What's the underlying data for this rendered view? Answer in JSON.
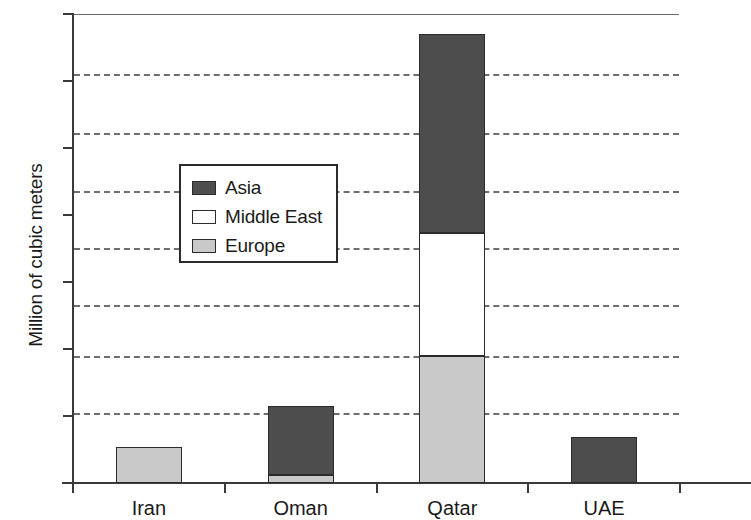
{
  "chart_data": {
    "type": "bar",
    "subtype": "stacked-vertical",
    "title": "",
    "xlabel": "",
    "ylabel": "Million of cubic meters",
    "categories": [
      "Iran",
      "Oman",
      "Qatar",
      "UAE"
    ],
    "series": [
      {
        "name": "Europe",
        "color": "#c9c9c9",
        "values": [
          5.3,
          1.2,
          19.0,
          0
        ]
      },
      {
        "name": "Middle East",
        "color": "#ffffff",
        "values": [
          0,
          0,
          18.3,
          0
        ]
      },
      {
        "name": "Asia",
        "color": "#4d4d4d",
        "values": [
          0,
          10.3,
          29.7,
          6.8
        ]
      }
    ],
    "totals": [
      5.3,
      11.5,
      67.0,
      6.8
    ],
    "stack_order": [
      "Europe",
      "Middle East",
      "Asia"
    ],
    "ylim": [
      0,
      70
    ],
    "yticks": [
      0,
      10,
      20,
      30,
      40,
      50,
      60,
      70
    ],
    "ytick_labels": [
      "0",
      "10",
      "20",
      "30",
      "40",
      "50",
      "60",
      "70"
    ],
    "gridlines": [
      10.5,
      19.0,
      26.6,
      35.1,
      43.6,
      52.2,
      61.0
    ],
    "grid": true,
    "grid_style": "dashed",
    "legend": {
      "position": "upper-left-inside",
      "entries": [
        {
          "label": "Asia",
          "color": "#4d4d4d"
        },
        {
          "label": "Middle East",
          "color": "#ffffff"
        },
        {
          "label": "Europe",
          "color": "#c9c9c9"
        }
      ]
    },
    "axis_color": "#3a3a3a",
    "grid_color": "#6e6e6e",
    "bar_edge_color": "#2b2b2b",
    "background": "#ffffff"
  }
}
